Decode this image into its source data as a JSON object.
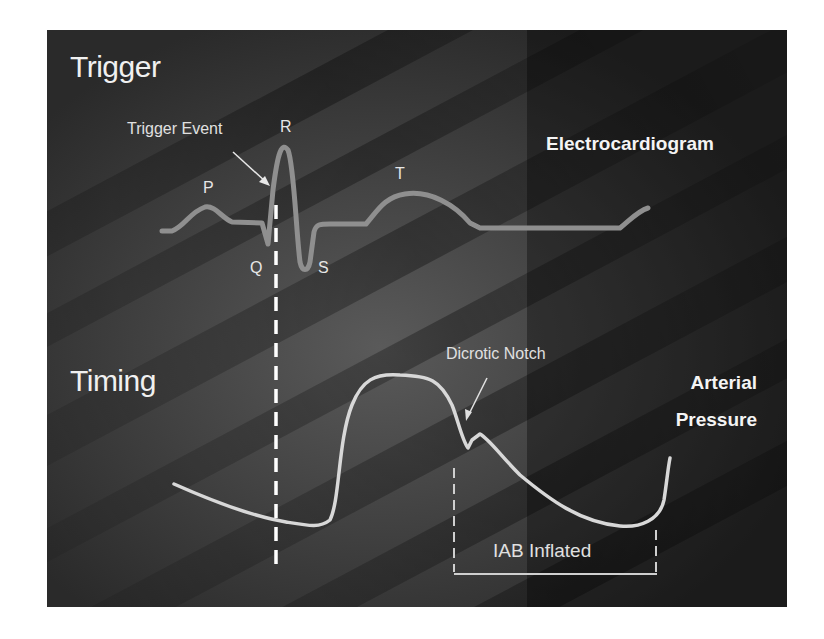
{
  "sections": {
    "trigger_title": "Trigger",
    "timing_title": "Timing"
  },
  "ecg": {
    "label": "Electrocardiogram",
    "waves": {
      "p": "P",
      "q": "Q",
      "r": "R",
      "s": "S",
      "t": "T"
    },
    "trigger_annotation": "Trigger Event"
  },
  "pressure": {
    "label_line1": "Arterial",
    "label_line2": "Pressure",
    "notch_annotation": "Dicrotic Notch",
    "inflation_label": "IAB Inflated"
  },
  "colors": {
    "background": "#3a3a3a",
    "ecg_trace": "#8f8f8f",
    "pressure_trace": "#d8d8d8",
    "text": "#f0f0f0",
    "dashed_line": "#ffffff"
  }
}
